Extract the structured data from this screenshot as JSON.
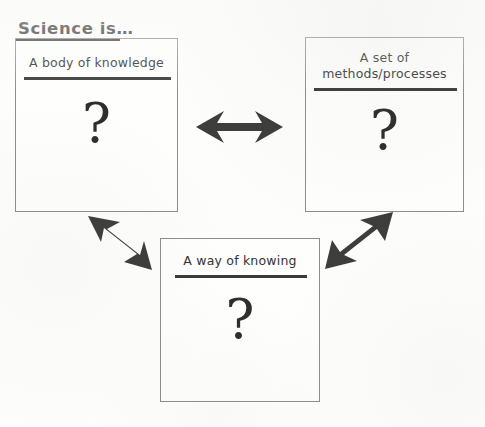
{
  "title": {
    "text": "Science is…"
  },
  "boxes": [
    {
      "id": "knowledge",
      "heading": "A body of knowledge",
      "symbol": "?"
    },
    {
      "id": "methods",
      "heading": "A set of\nmethods/processes",
      "symbol": "?"
    },
    {
      "id": "knowing",
      "heading": "A way of knowing",
      "symbol": "?"
    }
  ],
  "connectors": [
    {
      "id": "knowledge-methods",
      "label": "double-headed horizontal arrow",
      "from": "knowledge",
      "to": "methods",
      "direction": "bidirectional"
    },
    {
      "id": "knowledge-knowing",
      "label": "double-headed diagonal arrow",
      "from": "knowledge",
      "to": "knowing",
      "direction": "bidirectional"
    },
    {
      "id": "knowing-methods",
      "label": "double-headed diagonal arrow",
      "from": "knowing",
      "to": "methods",
      "direction": "bidirectional"
    }
  ],
  "colors": {
    "paper": "#fdfdfc",
    "ink": "#2f2f2f",
    "rule": "#3a3a3a",
    "box_border": "#8d8d8d",
    "arrow": "#3d3d3d"
  }
}
